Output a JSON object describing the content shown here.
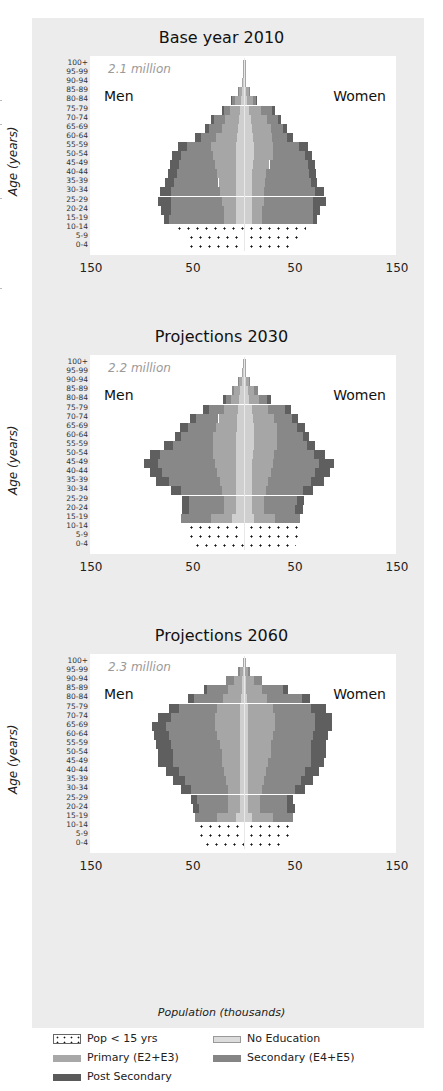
{
  "chart_data": {
    "type": "population_pyramid",
    "title": "",
    "xlabel": "Population (thousands)",
    "ylabel": "Age (years)",
    "x_ticks": [
      "150",
      "50",
      "50",
      "150"
    ],
    "x_tick_values": [
      -150,
      -50,
      50,
      150
    ],
    "xlim": [
      -150,
      150
    ],
    "age_groups": [
      "100+",
      "95-99",
      "90-94",
      "85-89",
      "80-84",
      "75-79",
      "70-74",
      "65-69",
      "60-64",
      "55-59",
      "50-54",
      "45-49",
      "40-44",
      "35-39",
      "30-34",
      "25-29",
      "20-24",
      "15-19",
      "10-14",
      "5-9",
      "0-4"
    ],
    "legend": [
      {
        "key": "under15",
        "label": "Pop < 15 yrs",
        "color": "#ffffff",
        "pattern": "dots"
      },
      {
        "key": "noedu",
        "label": "No Education",
        "color": "#dcdcdc"
      },
      {
        "key": "prim",
        "label": "Primary (E2+E3)",
        "color": "#a8a8a8"
      },
      {
        "key": "sec",
        "label": "Secondary (E4+E5)",
        "color": "#858585"
      },
      {
        "key": "post",
        "label": "Post Secondary",
        "color": "#5a5a5a"
      }
    ],
    "panels": [
      {
        "title": "Base year 2010",
        "total": "2.1 million",
        "men_label": "Men",
        "women_label": "Women",
        "men": {
          "noedu": [
            0.5,
            0.5,
            1,
            2,
            3,
            4,
            5,
            6,
            7,
            8,
            8,
            8,
            8,
            8,
            8,
            8,
            8,
            8
          ],
          "prim": [
            0.5,
            0.5,
            1,
            3,
            6,
            10,
            14,
            16,
            20,
            24,
            22,
            20,
            18,
            17,
            16,
            14,
            12,
            12
          ],
          "sec": [
            0,
            0,
            0,
            1,
            3,
            6,
            10,
            12,
            15,
            24,
            32,
            36,
            40,
            44,
            48,
            50,
            52,
            54
          ],
          "post": [
            0,
            0,
            0,
            0,
            1,
            2,
            3,
            4,
            6,
            9,
            9,
            9,
            9,
            8,
            10,
            12,
            9,
            4
          ],
          "under15": [
            null,
            null,
            null,
            null,
            null,
            null,
            null,
            null,
            null,
            null,
            null,
            null,
            null,
            null,
            null,
            null,
            null,
            null,
            70,
            58,
            58
          ]
        },
        "women": {
          "noedu": [
            0.5,
            0.5,
            1,
            2,
            3,
            5,
            7,
            8,
            9,
            10,
            10,
            9,
            8,
            8,
            8,
            8,
            8,
            8
          ],
          "prim": [
            0.5,
            0.5,
            1,
            3,
            6,
            12,
            16,
            18,
            18,
            18,
            18,
            16,
            14,
            13,
            12,
            12,
            10,
            10
          ],
          "sec": [
            0,
            0,
            0,
            1,
            3,
            10,
            10,
            12,
            15,
            26,
            32,
            38,
            42,
            45,
            50,
            48,
            50,
            50
          ],
          "post": [
            0,
            0,
            0,
            0,
            1,
            3,
            3,
            4,
            6,
            9,
            7,
            7,
            7,
            6,
            8,
            12,
            7,
            4
          ],
          "under15": [
            null,
            null,
            null,
            null,
            null,
            null,
            null,
            null,
            null,
            null,
            null,
            null,
            null,
            null,
            null,
            null,
            null,
            null,
            60,
            58,
            48
          ]
        }
      },
      {
        "title": "Projections 2030",
        "total": "2.2 million",
        "men_label": "Men",
        "women_label": "Women",
        "men": {
          "noedu": [
            0.5,
            1,
            2,
            4,
            5,
            6,
            7,
            7,
            8,
            8,
            8,
            8,
            8,
            8,
            8,
            8,
            8,
            12
          ],
          "prim": [
            0.5,
            1,
            3,
            6,
            8,
            14,
            18,
            20,
            22,
            22,
            22,
            20,
            18,
            16,
            14,
            12,
            12,
            20
          ],
          "sec": [
            0,
            0,
            1,
            2,
            5,
            14,
            22,
            28,
            32,
            40,
            52,
            56,
            54,
            50,
            40,
            34,
            34,
            30
          ],
          "post": [
            0,
            0,
            0,
            0,
            3,
            6,
            6,
            8,
            6,
            8,
            10,
            14,
            12,
            12,
            10,
            7,
            7,
            0
          ],
          "under15": [
            null,
            null,
            null,
            null,
            null,
            null,
            null,
            null,
            null,
            null,
            null,
            null,
            null,
            null,
            null,
            null,
            null,
            null,
            58,
            58,
            52
          ]
        },
        "women": {
          "noedu": [
            0.5,
            1,
            2,
            4,
            5,
            8,
            9,
            10,
            10,
            10,
            9,
            8,
            8,
            8,
            8,
            8,
            8,
            10
          ],
          "prim": [
            0.5,
            1,
            3,
            6,
            10,
            16,
            20,
            22,
            22,
            22,
            20,
            20,
            18,
            16,
            14,
            12,
            12,
            20
          ],
          "sec": [
            0,
            0,
            1,
            4,
            8,
            16,
            18,
            20,
            26,
            30,
            40,
            46,
            44,
            42,
            36,
            32,
            30,
            25
          ],
          "post": [
            0,
            0,
            0,
            0,
            3,
            6,
            6,
            8,
            6,
            8,
            10,
            14,
            14,
            12,
            10,
            7,
            8,
            0
          ],
          "under15": [
            null,
            null,
            null,
            null,
            null,
            null,
            null,
            null,
            null,
            null,
            null,
            null,
            null,
            null,
            null,
            null,
            null,
            null,
            56,
            56,
            50
          ]
        }
      },
      {
        "title": "Projections 2060",
        "total": "2.3 million",
        "men_label": "Men",
        "women_label": "Women",
        "men": {
          "noedu": [
            0.5,
            1,
            2,
            2,
            3,
            4,
            4,
            4,
            4,
            4,
            4,
            4,
            4,
            4,
            4,
            4,
            4,
            8
          ],
          "prim": [
            0.5,
            3,
            8,
            14,
            18,
            22,
            24,
            24,
            22,
            20,
            18,
            18,
            16,
            14,
            12,
            12,
            12,
            18
          ],
          "sec": [
            0,
            2,
            8,
            20,
            28,
            38,
            44,
            48,
            48,
            48,
            48,
            48,
            44,
            40,
            36,
            30,
            28,
            22
          ],
          "post": [
            0,
            0,
            0,
            3,
            6,
            10,
            12,
            14,
            14,
            14,
            14,
            14,
            12,
            12,
            10,
            6,
            6,
            0
          ],
          "under15": [
            null,
            null,
            null,
            null,
            null,
            null,
            null,
            null,
            null,
            null,
            null,
            null,
            null,
            null,
            null,
            null,
            null,
            null,
            48,
            48,
            42
          ]
        },
        "women": {
          "noedu": [
            0.5,
            1,
            2,
            2,
            3,
            4,
            4,
            4,
            4,
            4,
            4,
            4,
            4,
            4,
            4,
            4,
            4,
            8
          ],
          "prim": [
            0.5,
            3,
            8,
            16,
            20,
            24,
            26,
            26,
            24,
            22,
            22,
            20,
            18,
            16,
            14,
            12,
            12,
            20
          ],
          "sec": [
            0,
            2,
            8,
            20,
            34,
            38,
            40,
            40,
            40,
            40,
            40,
            42,
            38,
            36,
            32,
            26,
            26,
            20
          ],
          "post": [
            0,
            0,
            0,
            5,
            8,
            14,
            16,
            16,
            14,
            14,
            14,
            12,
            14,
            12,
            10,
            6,
            8,
            0
          ],
          "under15": [
            null,
            null,
            null,
            null,
            null,
            null,
            null,
            null,
            null,
            null,
            null,
            null,
            null,
            null,
            null,
            null,
            null,
            null,
            46,
            46,
            36
          ]
        }
      }
    ]
  }
}
